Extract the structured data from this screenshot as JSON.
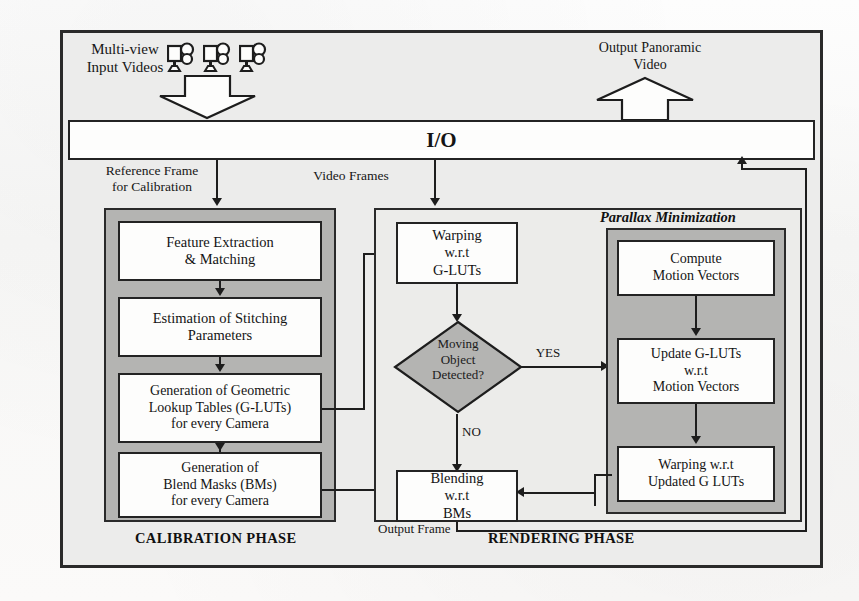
{
  "diagram": {
    "io_bar": {
      "label": "I/O"
    },
    "inputs": {
      "multiview_label": "Multi-view\nInput Videos",
      "multiview_line1": "Multi-view",
      "multiview_line2": "Input Videos",
      "camera_count": 3,
      "camera_icon": "video-camera-icon",
      "input_arrow": "big-down-arrow"
    },
    "outputs": {
      "panoramic_line1": "Output Panoramic",
      "panoramic_line2": "Video",
      "output_arrow": "big-up-arrow"
    },
    "edge_labels": {
      "reference_frame_line1": "Reference Frame",
      "reference_frame_line2": "for Calibration",
      "video_frames": "Video Frames",
      "yes": "YES",
      "no": "NO",
      "output_frame": "Output Frame"
    },
    "phases": [
      {
        "id": "calibration",
        "label": "CALIBRATION PHASE"
      },
      {
        "id": "rendering",
        "label": "RENDERING PHASE"
      }
    ],
    "calibration_blocks": [
      {
        "id": "feature-extraction",
        "lines": [
          "Feature Extraction",
          "& Matching"
        ],
        "italic": false
      },
      {
        "id": "estimation-stitching",
        "lines": [
          "Estimation of Stitching",
          "Parameters"
        ],
        "italic": false
      },
      {
        "id": "generation-glut",
        "lines": [
          "Generation of Geometric",
          "Lookup Tables (G-LUTs)",
          "for every Camera"
        ],
        "italic": false
      },
      {
        "id": "generation-bm",
        "lines": [
          "Generation of",
          "Blend Masks (BMs)",
          "for every Camera"
        ],
        "italic": false
      }
    ],
    "rendering_blocks": [
      {
        "id": "warping-glut",
        "lines": [
          "Warping",
          "w.r.t",
          "G-LUTs"
        ]
      },
      {
        "id": "blending-bm",
        "lines": [
          "Blending",
          "w.r.t",
          "BMs"
        ]
      }
    ],
    "decision": {
      "id": "moving-object-decision",
      "lines": [
        "Moving",
        "Object",
        "Detected?"
      ]
    },
    "parallax": {
      "title": "Parallax Minimization",
      "blocks": [
        {
          "id": "compute-motion-vectors",
          "lines": [
            "Compute",
            "Motion Vectors"
          ]
        },
        {
          "id": "update-glut",
          "lines": [
            "Update G-LUTs",
            "w.r.t",
            "Motion Vectors"
          ]
        },
        {
          "id": "warping-updated-glut",
          "lines": [
            "Warping w.r.t",
            "Updated G LUTs"
          ]
        }
      ]
    },
    "colors": {
      "page_background": "#fbfbfb",
      "panel_background": "#ececeb",
      "grey_panel": "#b4b4b2",
      "block_fill": "#fdfdfc",
      "decision_fill": "#b4b4b2",
      "line": "#1d1d1d",
      "frame": "#2a2a2a",
      "text": "#141414"
    }
  }
}
